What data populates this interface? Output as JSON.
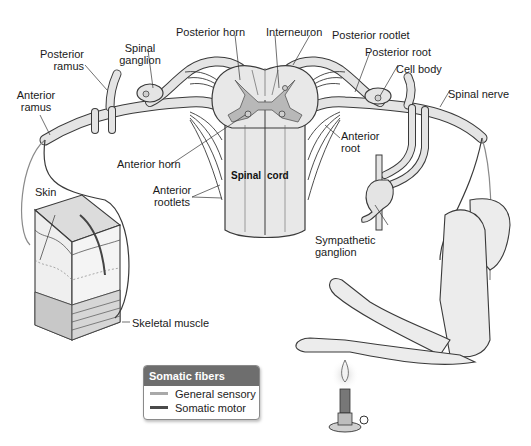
{
  "diagram": {
    "labels": {
      "posterior_horn": "Posterior horn",
      "interneuron": "Interneuron",
      "posterior_rootlet": "Posterior rootlet",
      "posterior_root": "Posterior root",
      "cell_body": "Cell body",
      "spinal_nerve": "Spinal nerve",
      "posterior_ramus_1": "Posterior",
      "posterior_ramus_2": "ramus",
      "spinal_ganglion_1": "Spinal",
      "spinal_ganglion_2": "ganglion",
      "anterior_ramus_1": "Anterior",
      "anterior_ramus_2": "ramus",
      "anterior_horn": "Anterior horn",
      "anterior_rootlets_1": "Anterior",
      "anterior_rootlets_2": "rootlets",
      "anterior_root_1": "Anterior",
      "anterior_root_2": "root",
      "spinal_cord_left": "Spinal",
      "spinal_cord_right": "cord",
      "skin": "Skin",
      "skeletal_muscle": "Skeletal muscle",
      "sympathetic_ganglion_1": "Sympathetic",
      "sympathetic_ganglion_2": "ganglion"
    }
  },
  "legend": {
    "title": "Somatic fibers",
    "items": [
      {
        "label": "General sensory",
        "color": "#a9a9a9"
      },
      {
        "label": "Somatic motor",
        "color": "#4a4a4a"
      }
    ]
  },
  "colors": {
    "nerve_fill": "#e4e4e4",
    "nerve_stroke": "#3a3a3a",
    "gray_matter": "#b8b8b8",
    "cord_fill": "#e8e8e8",
    "legend_header": "#6e6e6e"
  }
}
